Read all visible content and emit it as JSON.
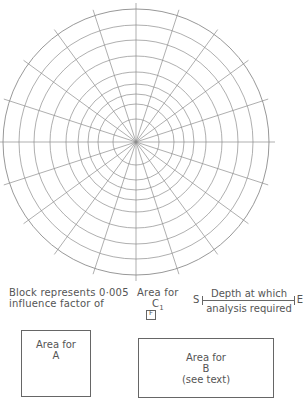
{
  "figure": {
    "type": "Newmark influence chart",
    "rings": 9,
    "radial_lines": 20,
    "stroke_color": "#8c8c8c"
  },
  "legend": {
    "block_text_line1": "Block represents 0·005",
    "block_text_line2": "influence factor of",
    "cbox_label": "Area for",
    "cbox_sub": "C",
    "cbox_sub_index": "1",
    "cbox_mark": "F"
  },
  "depth_scale": {
    "start_label": "S",
    "end_label": "E",
    "top_text": "Depth at which",
    "bottom_text": "analysis required"
  },
  "area_a": {
    "line1": "Area for",
    "line2": "A"
  },
  "area_b": {
    "line1": "Area for",
    "line2": "B",
    "line3": "(see text)"
  }
}
